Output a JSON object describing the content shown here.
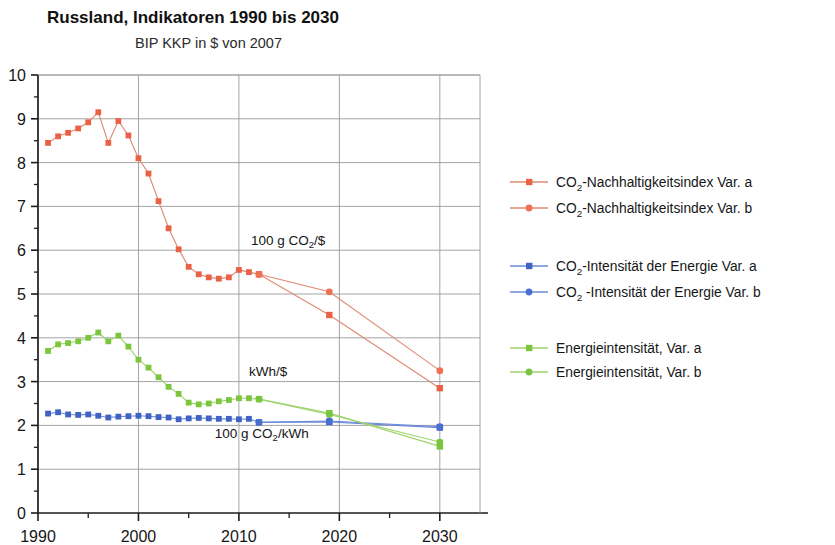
{
  "header": {
    "title": "Russland, Indikatoren 1990 bis 2030",
    "subtitle": "BIP KKP in $ von 2007"
  },
  "colors": {
    "red_a": "#ea6245",
    "red_b": "#ef7054",
    "red_line": "#e08a72",
    "blue_a": "#3f62c4",
    "blue_b": "#4a6fd0",
    "blue_line": "#6b8bd8",
    "green_a": "#7cc63f",
    "green_b": "#79c441",
    "green_line": "#9ed46e",
    "grid": "#9a9a9a",
    "axis": "#1c1c1c"
  },
  "legend": {
    "position": "right",
    "items": [
      {
        "label_main": "CO",
        "label_sub": "2",
        "label_rest": "-Nachhaltigkeitsindex Var. a",
        "color": "#ea6245",
        "marker": "square"
      },
      {
        "label_main": "CO",
        "label_sub": "2",
        "label_rest": "-Nachhaltigkeitsindex Var. b",
        "color": "#ef7054",
        "marker": "circle"
      },
      {
        "label_main": "CO",
        "label_sub": "2",
        "label_rest": "-Intensität der Energie Var. a",
        "color": "#3f62c4",
        "marker": "square"
      },
      {
        "label_main": "CO",
        "label_sub": "2",
        "label_rest": " -Intensität der Energie Var. b",
        "color": "#4a6fd0",
        "marker": "circle"
      },
      {
        "label_main": "Energieintensität, Var. a",
        "label_sub": "",
        "label_rest": "",
        "color": "#7cc63f",
        "marker": "square"
      },
      {
        "label_main": "Energieintensität, Var. b",
        "label_sub": "",
        "label_rest": "",
        "color": "#79c441",
        "marker": "circle"
      }
    ]
  },
  "annotations": [
    {
      "name": "annotation-co2-per-dollar",
      "main": "100 g CO",
      "sub": "2",
      "rest": "/$",
      "x": 2011.2,
      "y": 6.12
    },
    {
      "name": "annotation-kwh-per-dollar",
      "main": "kWh/$",
      "sub": "",
      "rest": "",
      "x": 2011.0,
      "y": 3.12
    },
    {
      "name": "annotation-co2-per-kwh",
      "main": "100 g CO",
      "sub": "2",
      "rest": "/kWh",
      "x": 2007.6,
      "y": 1.72
    }
  ],
  "chart_data": {
    "type": "line",
    "title": "Russland, Indikatoren 1990 bis 2030",
    "subtitle": "BIP KKP in $ von 2007",
    "xlabel": "",
    "ylabel": "",
    "xlim": [
      1990,
      2034
    ],
    "ylim": [
      0,
      10
    ],
    "ytick_labels": [
      "0",
      "1",
      "2",
      "3",
      "4",
      "5",
      "6",
      "7",
      "8",
      "9",
      "10"
    ],
    "ytick_values": [
      0,
      1,
      2,
      3,
      4,
      5,
      6,
      7,
      8,
      9,
      10
    ],
    "yminor_values": [
      0.5,
      1.5,
      2.5,
      3.5,
      4.5,
      5.5,
      6.5,
      7.5,
      8.5,
      9.5
    ],
    "xtick_labels": [
      "1990",
      "2000",
      "2010",
      "2020",
      "2030"
    ],
    "xtick_values": [
      1990,
      2000,
      2010,
      2020,
      2030
    ],
    "xminor_values": [
      1995,
      2005,
      2015,
      2025
    ],
    "grid": "horizontal-and-vertical-major",
    "series": [
      {
        "name": "CO2-Nachhaltigkeitsindex Var. a",
        "color": "#ea6245",
        "marker": "square",
        "x": [
          1991,
          1992,
          1993,
          1994,
          1995,
          1996,
          1997,
          1998,
          1999,
          2000,
          2001,
          2002,
          2003,
          2004,
          2005,
          2006,
          2007,
          2008,
          2009,
          2010,
          2011,
          2012,
          2019,
          2030
        ],
        "values": [
          8.45,
          8.6,
          8.68,
          8.78,
          8.92,
          9.15,
          8.45,
          8.95,
          8.62,
          8.1,
          7.75,
          7.12,
          6.5,
          6.02,
          5.62,
          5.45,
          5.38,
          5.35,
          5.38,
          5.55,
          5.5,
          5.45,
          4.52,
          2.85
        ]
      },
      {
        "name": "CO2-Nachhaltigkeitsindex Var. b",
        "color": "#ef7054",
        "marker": "circle",
        "x": [
          2012,
          2019,
          2030
        ],
        "values": [
          5.45,
          5.05,
          3.25
        ]
      },
      {
        "name": "CO2-Intensität der Energie Var. a",
        "color": "#3f62c4",
        "marker": "square",
        "x": [
          1991,
          1992,
          1993,
          1994,
          1995,
          1996,
          1997,
          1998,
          1999,
          2000,
          2001,
          2002,
          2003,
          2004,
          2005,
          2006,
          2007,
          2008,
          2009,
          2010,
          2011,
          2012,
          2019,
          2030
        ],
        "values": [
          2.27,
          2.3,
          2.25,
          2.24,
          2.25,
          2.22,
          2.18,
          2.2,
          2.21,
          2.22,
          2.21,
          2.19,
          2.18,
          2.14,
          2.16,
          2.17,
          2.16,
          2.15,
          2.15,
          2.14,
          2.15,
          2.07,
          2.08,
          1.95
        ]
      },
      {
        "name": "CO2-Intensität der Energie Var. b",
        "color": "#4a6fd0",
        "marker": "circle",
        "x": [
          2012,
          2019,
          2030
        ],
        "values": [
          2.07,
          2.1,
          1.97
        ]
      },
      {
        "name": "Energieintensität, Var. a",
        "color": "#7cc63f",
        "marker": "square",
        "x": [
          1991,
          1992,
          1993,
          1994,
          1995,
          1996,
          1997,
          1998,
          1999,
          2000,
          2001,
          2002,
          2003,
          2004,
          2005,
          2006,
          2007,
          2008,
          2009,
          2010,
          2011,
          2012,
          2019,
          2030
        ],
        "values": [
          3.7,
          3.85,
          3.88,
          3.92,
          4.0,
          4.12,
          3.92,
          4.05,
          3.8,
          3.5,
          3.32,
          3.1,
          2.88,
          2.72,
          2.52,
          2.48,
          2.5,
          2.55,
          2.58,
          2.62,
          2.62,
          2.6,
          2.28,
          1.52
        ]
      },
      {
        "name": "Energieintensität, Var. b",
        "color": "#79c441",
        "marker": "circle",
        "x": [
          2012,
          2019,
          2030
        ],
        "values": [
          2.6,
          2.25,
          1.62
        ]
      }
    ]
  }
}
